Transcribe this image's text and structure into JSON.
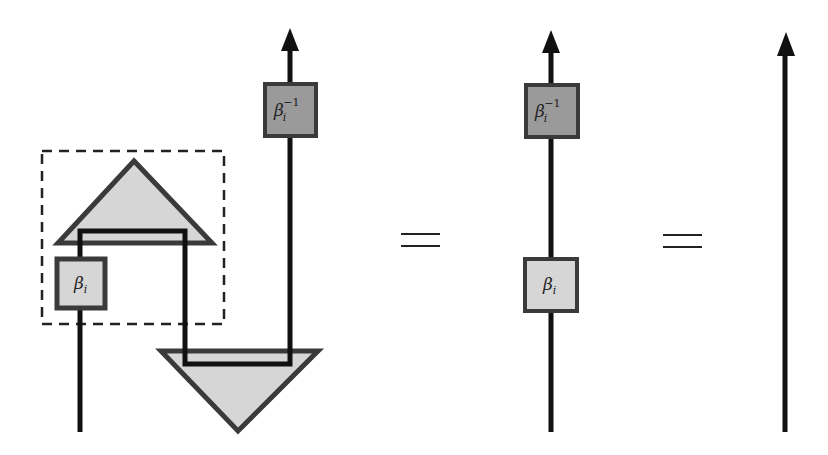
{
  "diagram": {
    "type": "string-diagram-equation",
    "colors": {
      "stroke": "#1a1a1a",
      "light_fill": "#d6d6d6",
      "dark_fill": "#9a9a9a",
      "frame_stroke": "#3a3a3a"
    },
    "panels": [
      {
        "id": "left",
        "description": "cup/cap with beta_i and beta_i inverse, dashed box around cap and beta_i",
        "labels": {
          "beta": "β",
          "beta_sub": "i",
          "beta_inv": "β",
          "beta_inv_sub": "i",
          "beta_inv_sup": "−1"
        }
      },
      {
        "id": "middle",
        "labels": {
          "beta": "β",
          "beta_sub": "i",
          "beta_inv": "β",
          "beta_inv_sub": "i",
          "beta_inv_sup": "−1"
        }
      },
      {
        "id": "right",
        "description": "plain upward arrow (identity)"
      }
    ],
    "equals": [
      "=",
      "="
    ]
  }
}
